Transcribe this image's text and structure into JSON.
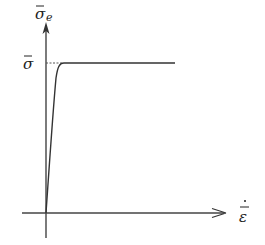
{
  "diagram": {
    "type": "stress-strain-rate curve",
    "y_axis_label": "σ̄",
    "y_axis_subscript": "e",
    "x_axis_label": "ε̄̇",
    "plateau_label": "σ̄",
    "colors": {
      "line": "#333333",
      "axis": "#444444",
      "dashed": "#555555",
      "background": "#ffffff"
    },
    "geometry": {
      "origin": [
        46,
        213
      ],
      "y_axis_top": [
        46,
        24
      ],
      "y_axis_bottom": [
        46,
        238
      ],
      "x_axis_left": [
        22,
        213
      ],
      "x_axis_right": [
        226,
        213
      ],
      "plateau_y": 63,
      "plateau_end_x": 175
    }
  }
}
